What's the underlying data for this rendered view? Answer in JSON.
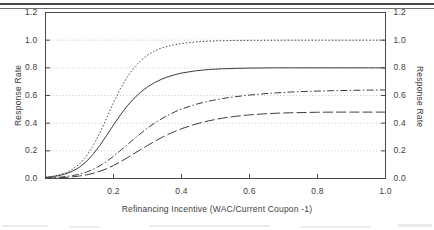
{
  "chart_data": {
    "type": "line",
    "title": "",
    "xlabel": "Refinancing Incentive (WAC/Current Coupon -1)",
    "ylabel": "Response Rate",
    "ylabel_right": "Response Rate",
    "xlim": [
      0.0,
      1.0
    ],
    "ylim": [
      0.0,
      1.2
    ],
    "grid": true,
    "grid_style": "dotted-horizontal",
    "legend": "none",
    "x_ticks": [
      0.0,
      0.2,
      0.4,
      0.6,
      0.8,
      1.0
    ],
    "x_tick_labels": [
      "",
      "0.2",
      "0.4",
      "0.6",
      "0.8",
      "1.0"
    ],
    "y_ticks": [
      0.0,
      0.2,
      0.4,
      0.6,
      0.8,
      1.0,
      1.2
    ],
    "y_tick_labels": [
      "0.0",
      "0.2",
      "0.4",
      "0.6",
      "0.8",
      "1.0",
      "1.2"
    ],
    "y_ticks_right": [
      0.0,
      0.2,
      0.4,
      0.6,
      0.8,
      1.0,
      1.2
    ],
    "y_tick_labels_right": [
      "0.0",
      "0.2",
      "0.4",
      "0.6",
      "0.8",
      "1.0",
      "1.2"
    ],
    "x": [
      0.0,
      0.02,
      0.04,
      0.06,
      0.08,
      0.1,
      0.12,
      0.14,
      0.16,
      0.18,
      0.2,
      0.22,
      0.24,
      0.26,
      0.28,
      0.3,
      0.32,
      0.34,
      0.36,
      0.38,
      0.4,
      0.44,
      0.48,
      0.52,
      0.56,
      0.6,
      0.64,
      0.68,
      0.72,
      0.76,
      0.8,
      0.85,
      0.9,
      0.95,
      1.0
    ],
    "series": [
      {
        "name": "fastest-response",
        "style": "dotted",
        "color": "#3d3d3d",
        "asymptote": 1.0,
        "values": [
          0.01,
          0.016,
          0.026,
          0.042,
          0.067,
          0.105,
          0.16,
          0.235,
          0.33,
          0.438,
          0.548,
          0.648,
          0.732,
          0.8,
          0.852,
          0.892,
          0.921,
          0.942,
          0.957,
          0.968,
          0.976,
          0.987,
          0.993,
          0.996,
          0.998,
          0.999,
          0.999,
          1.0,
          1.0,
          1.0,
          1.0,
          1.0,
          1.0,
          1.0,
          1.0
        ]
      },
      {
        "name": "base-response",
        "style": "solid",
        "color": "#3d3d3d",
        "asymptote": 0.8,
        "values": [
          0.008,
          0.013,
          0.021,
          0.034,
          0.053,
          0.082,
          0.122,
          0.175,
          0.24,
          0.312,
          0.387,
          0.458,
          0.523,
          0.578,
          0.624,
          0.662,
          0.692,
          0.716,
          0.735,
          0.75,
          0.762,
          0.778,
          0.788,
          0.793,
          0.796,
          0.798,
          0.799,
          0.8,
          0.8,
          0.8,
          0.8,
          0.8,
          0.8,
          0.8,
          0.8
        ]
      },
      {
        "name": "slow-response",
        "style": "dash-dot",
        "color": "#3d3d3d",
        "asymptote": 0.64,
        "values": [
          0.004,
          0.006,
          0.009,
          0.014,
          0.021,
          0.031,
          0.046,
          0.066,
          0.092,
          0.124,
          0.161,
          0.201,
          0.243,
          0.285,
          0.326,
          0.364,
          0.399,
          0.43,
          0.457,
          0.481,
          0.502,
          0.535,
          0.559,
          0.578,
          0.592,
          0.603,
          0.612,
          0.619,
          0.625,
          0.629,
          0.632,
          0.635,
          0.637,
          0.639,
          0.64
        ]
      },
      {
        "name": "slowest-response",
        "style": "long-dash",
        "color": "#3d3d3d",
        "asymptote": 0.48,
        "values": [
          0.002,
          0.003,
          0.005,
          0.008,
          0.012,
          0.018,
          0.026,
          0.037,
          0.052,
          0.071,
          0.094,
          0.12,
          0.149,
          0.179,
          0.209,
          0.239,
          0.267,
          0.294,
          0.318,
          0.34,
          0.36,
          0.392,
          0.417,
          0.436,
          0.45,
          0.46,
          0.467,
          0.472,
          0.475,
          0.477,
          0.479,
          0.48,
          0.48,
          0.48,
          0.48
        ]
      }
    ]
  }
}
